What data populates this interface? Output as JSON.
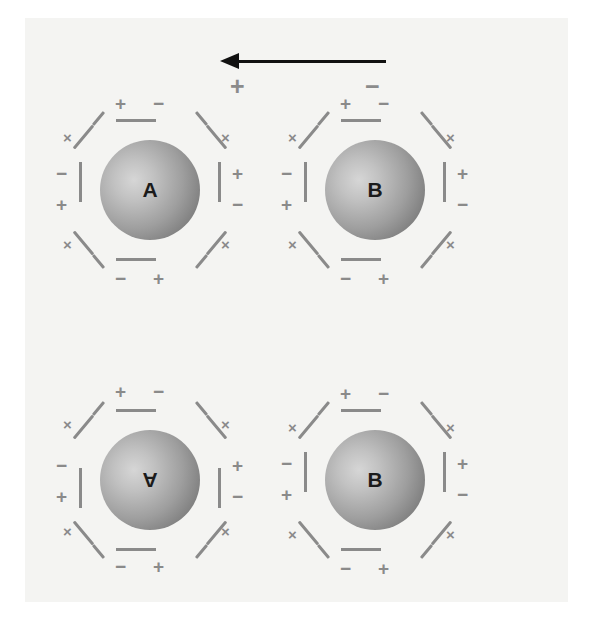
{
  "figure": {
    "background_color": "#f4f4f2",
    "sign_color": "#8a8a8a",
    "arrow_color": "#111111"
  },
  "field_indicator": {
    "name": "external-field-arrow",
    "direction": "right-to-left",
    "positive_label": "+",
    "negative_label": "−"
  },
  "signs": {
    "plus": "+",
    "minus": "−",
    "cross": "×"
  },
  "cells": [
    {
      "id": "top-left",
      "label": "A",
      "orientation": "normal",
      "left": 52,
      "top": 92,
      "top_signs": [
        "+",
        "−"
      ],
      "bottom_signs": [
        "−",
        "+"
      ],
      "left_signs": [
        "−",
        "+"
      ],
      "right_signs": [
        "+",
        "−"
      ]
    },
    {
      "id": "top-right",
      "label": "B",
      "orientation": "normal",
      "left": 277,
      "top": 92,
      "top_signs": [
        "+",
        "−"
      ],
      "bottom_signs": [
        "−",
        "+"
      ],
      "left_signs": [
        "−",
        "+"
      ],
      "right_signs": [
        "+",
        "−"
      ]
    },
    {
      "id": "bottom-left",
      "label": "A",
      "orientation": "flipped",
      "left": 52,
      "top": 382,
      "top_signs": [
        "−",
        "+"
      ],
      "bottom_signs": [
        "+",
        "−"
      ],
      "left_signs": [
        "+",
        "−"
      ],
      "right_signs": [
        "−",
        "+"
      ]
    },
    {
      "id": "bottom-right",
      "label": "B",
      "orientation": "normal",
      "left": 277,
      "top": 382,
      "top_signs": [
        "+",
        "−"
      ],
      "bottom_signs": [
        "−",
        "+"
      ],
      "left_signs": [
        "−",
        "+"
      ],
      "right_signs": [
        "+",
        "−"
      ]
    }
  ]
}
